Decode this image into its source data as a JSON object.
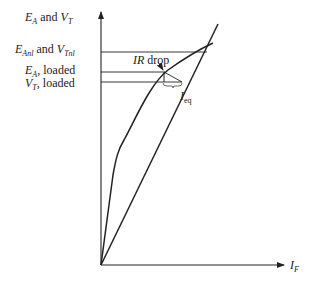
{
  "diagram": {
    "type": "generator-characteristic",
    "y_axis": {
      "symbol": "E",
      "sub": "A",
      "conj": " and ",
      "symbol2": "V",
      "sub2": "T"
    },
    "x_axis": {
      "symbol": "I",
      "sub": "F"
    },
    "levels": [
      {
        "id": "no-load",
        "symbol": "E",
        "sub": "Anl",
        "conj": " and ",
        "symbol2": "V",
        "sub2": "Tnl"
      },
      {
        "id": "ea-loaded",
        "symbol": "E",
        "sub": "A",
        "suffix": ",  loaded"
      },
      {
        "id": "vt-loaded",
        "symbol": "V",
        "sub": "T",
        "suffix": ",  loaded"
      }
    ],
    "annotations": {
      "ir_drop": {
        "italic": "IR",
        "text": " drop"
      },
      "i_eq": {
        "symbol": "I",
        "sub": "eq"
      }
    },
    "colors": {
      "ink": "#222222",
      "background": "#ffffff"
    }
  }
}
